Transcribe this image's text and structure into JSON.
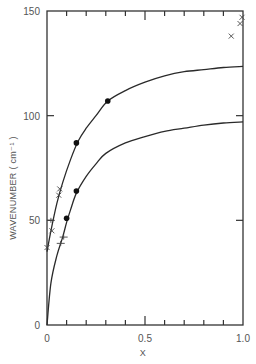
{
  "chart_data": {
    "type": "scatter",
    "title": "",
    "xlabel": "X",
    "ylabel": "WAVENUMBER ( cm⁻¹ )",
    "xlim": [
      0,
      1.0
    ],
    "ylim": [
      0,
      150
    ],
    "x_ticks": [
      0,
      0.1,
      0.2,
      0.3,
      0.4,
      0.5,
      0.6,
      0.7,
      0.8,
      0.9,
      1.0
    ],
    "x_tick_labels": [
      {
        "value": 0,
        "label": "0"
      },
      {
        "value": 0.5,
        "label": "0.5"
      },
      {
        "value": 1.0,
        "label": "1.0"
      }
    ],
    "y_tick_labels": [
      {
        "value": 0,
        "label": "0"
      },
      {
        "value": 50,
        "label": "50"
      },
      {
        "value": 100,
        "label": "100"
      },
      {
        "value": 150,
        "label": "150"
      }
    ],
    "grid": false,
    "legend": null,
    "series": [
      {
        "name": "upper-fit-curve",
        "kind": "line",
        "x": [
          0,
          0.02,
          0.05,
          0.08,
          0.12,
          0.16,
          0.2,
          0.25,
          0.31,
          0.4,
          0.5,
          0.6,
          0.7,
          0.8,
          0.9,
          1.0
        ],
        "y": [
          35,
          45,
          58,
          68,
          79,
          88,
          94,
          100,
          107,
          112,
          116,
          119,
          121,
          122,
          123,
          123.5
        ]
      },
      {
        "name": "lower-fit-curve",
        "kind": "line",
        "x": [
          0,
          0.02,
          0.05,
          0.08,
          0.1,
          0.12,
          0.15,
          0.2,
          0.25,
          0.3,
          0.4,
          0.5,
          0.6,
          0.7,
          0.8,
          0.9,
          1.0
        ],
        "y": [
          0,
          20,
          33,
          42,
          49,
          55,
          63,
          71,
          77,
          82,
          87,
          90,
          92.5,
          94,
          95.5,
          96.5,
          97
        ]
      },
      {
        "name": "upper-dots",
        "kind": "filled-circle",
        "x": [
          0.15,
          0.31
        ],
        "y": [
          87,
          107
        ]
      },
      {
        "name": "lower-dots",
        "kind": "filled-circle",
        "x": [
          0.1,
          0.15
        ],
        "y": [
          51,
          64
        ]
      },
      {
        "name": "crosses-x",
        "kind": "x-marker",
        "x": [
          0.0,
          0.025,
          0.06,
          0.065,
          0.94,
          0.985,
          0.995
        ],
        "y": [
          37,
          45,
          62,
          65,
          138,
          144,
          147
        ]
      },
      {
        "name": "crosses-plus",
        "kind": "plus-marker",
        "x": [
          0.02,
          0.07,
          0.085
        ],
        "y": [
          50,
          39,
          42
        ]
      }
    ]
  }
}
